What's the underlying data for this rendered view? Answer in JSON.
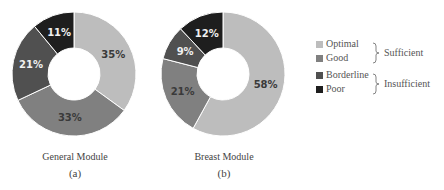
{
  "chart_data": [
    {
      "type": "pie",
      "variant": "donut",
      "title": "General Module",
      "panel": "(a)",
      "categories": [
        "Optimal",
        "Good",
        "Borderline",
        "Poor"
      ],
      "values": [
        35,
        33,
        21,
        11
      ],
      "labels": [
        "35%",
        "33%",
        "21%",
        "11%"
      ]
    },
    {
      "type": "pie",
      "variant": "donut",
      "title": "Breast Module",
      "panel": "(b)",
      "categories": [
        "Optimal",
        "Good",
        "Borderline",
        "Poor"
      ],
      "values": [
        58,
        21,
        9,
        12
      ],
      "labels": [
        "58%",
        "21%",
        "9%",
        "12%"
      ]
    }
  ],
  "legend": {
    "items": [
      {
        "label": "Optimal",
        "color": "#bdbdbd"
      },
      {
        "label": "Good",
        "color": "#808080"
      },
      {
        "label": "Borderline",
        "color": "#505050"
      },
      {
        "label": "Poor",
        "color": "#1e1e1e"
      }
    ],
    "groups": [
      {
        "label": "Sufficient",
        "members": [
          "Optimal",
          "Good"
        ]
      },
      {
        "label": "Insufficient",
        "members": [
          "Borderline",
          "Poor"
        ]
      }
    ]
  },
  "captions": {
    "a": {
      "title": "General Module",
      "panel": "(a)"
    },
    "b": {
      "title": "Breast Module",
      "panel": "(b)"
    }
  },
  "colors": {
    "optimal": "#bdbdbd",
    "good": "#808080",
    "borderline": "#505050",
    "poor": "#1e1e1e",
    "label_dark": "#3a3a3a",
    "label_light": "#f0f0f0"
  }
}
